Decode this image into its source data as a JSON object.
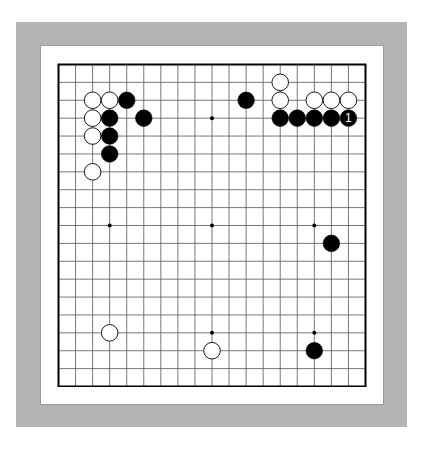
{
  "board": {
    "size": 19,
    "colors": {
      "frame": "#b4b4b4",
      "panel": "#ffffff",
      "grid": "#555555",
      "border": "#000000",
      "black_stone": "#000000",
      "white_stone": "#ffffff",
      "label_on_black": "#ffffff"
    },
    "hoshi": [
      [
        3,
        3
      ],
      [
        9,
        3
      ],
      [
        15,
        3
      ],
      [
        3,
        9
      ],
      [
        9,
        9
      ],
      [
        15,
        9
      ],
      [
        3,
        15
      ],
      [
        9,
        15
      ],
      [
        15,
        15
      ]
    ],
    "stones": [
      {
        "color": "white",
        "col": 2,
        "row": 2
      },
      {
        "color": "white",
        "col": 3,
        "row": 2
      },
      {
        "color": "black",
        "col": 4,
        "row": 2
      },
      {
        "color": "white",
        "col": 2,
        "row": 3
      },
      {
        "color": "black",
        "col": 3,
        "row": 3
      },
      {
        "color": "black",
        "col": 5,
        "row": 3
      },
      {
        "color": "white",
        "col": 2,
        "row": 4
      },
      {
        "color": "black",
        "col": 3,
        "row": 4
      },
      {
        "color": "black",
        "col": 3,
        "row": 5
      },
      {
        "color": "white",
        "col": 2,
        "row": 6
      },
      {
        "color": "black",
        "col": 11,
        "row": 2
      },
      {
        "color": "white",
        "col": 13,
        "row": 1
      },
      {
        "color": "white",
        "col": 13,
        "row": 2
      },
      {
        "color": "white",
        "col": 15,
        "row": 2
      },
      {
        "color": "white",
        "col": 16,
        "row": 2
      },
      {
        "color": "white",
        "col": 17,
        "row": 2
      },
      {
        "color": "black",
        "col": 13,
        "row": 3
      },
      {
        "color": "black",
        "col": 14,
        "row": 3
      },
      {
        "color": "black",
        "col": 15,
        "row": 3
      },
      {
        "color": "black",
        "col": 16,
        "row": 3
      },
      {
        "color": "black",
        "col": 17,
        "row": 3,
        "label": "1"
      },
      {
        "color": "black",
        "col": 16,
        "row": 10
      },
      {
        "color": "white",
        "col": 3,
        "row": 15
      },
      {
        "color": "white",
        "col": 9,
        "row": 16
      },
      {
        "color": "black",
        "col": 15,
        "row": 16
      }
    ]
  }
}
